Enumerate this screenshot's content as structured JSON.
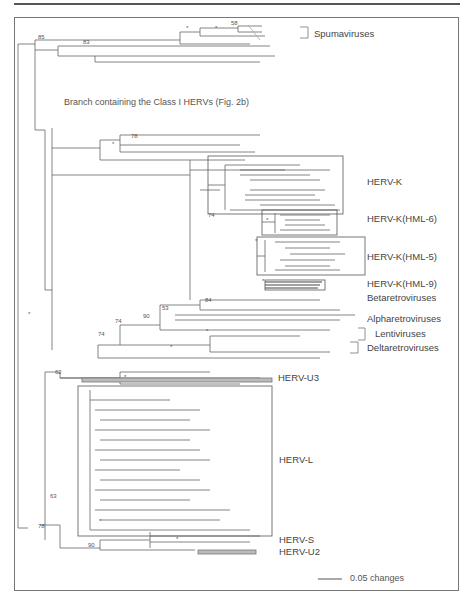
{
  "figure": {
    "branch_note": "Branch containing the Class I HERVs (Fig. 2b)",
    "scale_bar": {
      "label": "0.05 changes"
    },
    "clades": [
      {
        "id": "spuma",
        "label": "Spumaviruses",
        "x": 314,
        "y": 34
      },
      {
        "id": "hervk",
        "label": "HERV-K",
        "x": 367,
        "y": 182
      },
      {
        "id": "hml6",
        "label": "HERV-K(HML-6)",
        "x": 367,
        "y": 219
      },
      {
        "id": "hml5",
        "label": "HERV-K(HML-5)",
        "x": 367,
        "y": 257
      },
      {
        "id": "hml9",
        "label": "HERV-K(HML-9)",
        "x": 367,
        "y": 284
      },
      {
        "id": "beta",
        "label": "Betaretroviruses",
        "x": 367,
        "y": 298
      },
      {
        "id": "alpha",
        "label": "Alpharetroviruses",
        "x": 367,
        "y": 319
      },
      {
        "id": "lenti",
        "label": "Lentiviruses",
        "x": 375,
        "y": 334
      },
      {
        "id": "delta",
        "label": "Deltaretroviruses",
        "x": 367,
        "y": 348
      },
      {
        "id": "u3",
        "label": "HERV-U3",
        "x": 278,
        "y": 378
      },
      {
        "id": "hervl",
        "label": "HERV-L",
        "x": 279,
        "y": 460
      },
      {
        "id": "hervs",
        "label": "HERV-S",
        "x": 279,
        "y": 540
      },
      {
        "id": "u2",
        "label": "HERV-U2",
        "x": 279,
        "y": 552
      }
    ],
    "support_values": [
      {
        "v": "*",
        "x": 186,
        "y": 30
      },
      {
        "v": "*",
        "x": 215,
        "y": 30
      },
      {
        "v": "58",
        "x": 231,
        "y": 25
      },
      {
        "v": "85",
        "x": 38,
        "y": 39
      },
      {
        "v": "83",
        "x": 83,
        "y": 44
      },
      {
        "v": "78",
        "x": 131,
        "y": 138
      },
      {
        "v": "*",
        "x": 112,
        "y": 146
      },
      {
        "v": "74",
        "x": 208,
        "y": 217
      },
      {
        "v": "*",
        "x": 266,
        "y": 222
      },
      {
        "v": "*",
        "x": 255,
        "y": 243
      },
      {
        "v": "*",
        "x": 262,
        "y": 283
      },
      {
        "v": "84",
        "x": 205,
        "y": 302
      },
      {
        "v": "53",
        "x": 162,
        "y": 310
      },
      {
        "v": "90",
        "x": 143,
        "y": 318
      },
      {
        "v": "74",
        "x": 115,
        "y": 323
      },
      {
        "v": "74",
        "x": 98,
        "y": 336
      },
      {
        "v": "*",
        "x": 206,
        "y": 333
      },
      {
        "v": "*",
        "x": 170,
        "y": 349
      },
      {
        "v": "*",
        "x": 28,
        "y": 316
      },
      {
        "v": "62",
        "x": 55,
        "y": 374
      },
      {
        "v": "*",
        "x": 124,
        "y": 379
      },
      {
        "v": "63",
        "x": 50,
        "y": 498
      },
      {
        "v": "78",
        "x": 38,
        "y": 528
      },
      {
        "v": "*",
        "x": 99,
        "y": 523
      },
      {
        "v": "90",
        "x": 88,
        "y": 547
      },
      {
        "v": "*",
        "x": 176,
        "y": 541
      }
    ]
  }
}
